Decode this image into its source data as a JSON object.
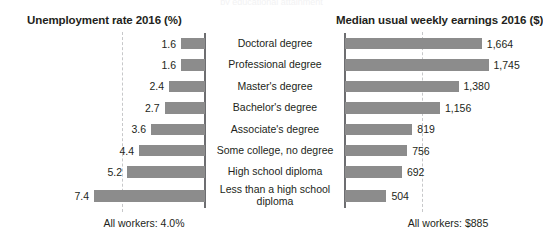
{
  "chart_data": {
    "type": "bar",
    "layout": "back-to-back horizontal bar (butterfly) chart, two panels sharing centered category labels",
    "categories": [
      "Doctoral degree",
      "Professional degree",
      "Master's degree",
      "Bachelor's degree",
      "Associate's degree",
      "Some college, no degree",
      "High school diploma",
      "Less than a high school diploma"
    ],
    "panels": [
      {
        "id": "unemployment",
        "title": "Unemployment rate 2016 (%)",
        "direction": "left",
        "unit": "%",
        "values": [
          1.6,
          1.6,
          2.4,
          2.7,
          3.6,
          4.4,
          5.2,
          7.4
        ],
        "value_labels": [
          "1.6",
          "1.6",
          "2.4",
          "2.7",
          "3.6",
          "4.4",
          "5.2",
          "7.4"
        ],
        "xlim": [
          0,
          8
        ],
        "reference_line": {
          "value": 4.0,
          "label": "All workers: 4.0%",
          "style": "dashed"
        },
        "footnote": "All workers: 4.0%"
      },
      {
        "id": "earnings",
        "title": "Median usual weekly earnings 2016 ($)",
        "direction": "right",
        "unit": "$",
        "values": [
          1664,
          1745,
          1380,
          1156,
          819,
          756,
          692,
          504
        ],
        "value_labels": [
          "1,664",
          "1,745",
          "1,380",
          "1,156",
          "819",
          "756",
          "692",
          "504"
        ],
        "xlim": [
          0,
          1800
        ],
        "reference_line": {
          "value": 885,
          "label": "All workers: $885",
          "style": "dashed"
        },
        "footnote": "All workers: $885"
      }
    ],
    "grid": false,
    "legend": "none",
    "colors": {
      "bar": "#8c8c8c",
      "text": "#231f20",
      "axis": "#6d6e71",
      "reference_line": "#c7c8ca",
      "background": "#ffffff"
    }
  },
  "clipped_header": "by educational attainment"
}
